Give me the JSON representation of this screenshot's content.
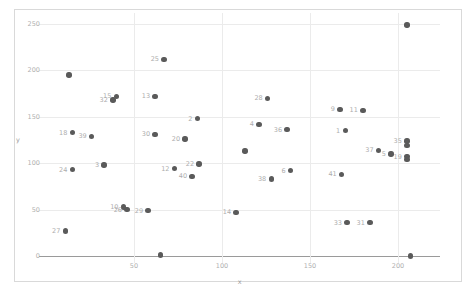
{
  "chart_data": {
    "type": "scatter",
    "title": "",
    "xlabel": "x",
    "ylabel": "y",
    "xlim": [
      -4,
      224
    ],
    "ylim": [
      -8,
      262
    ],
    "xticks": [
      50,
      100,
      150,
      200
    ],
    "yticks": [
      0,
      50,
      100,
      150,
      200,
      250
    ],
    "grid": true,
    "legend": "none",
    "point_color": "#5a5a5a",
    "label_color": "#adadad",
    "grid_color": "#ebebeb",
    "axis_color": "#9a9a9a",
    "points": [
      {
        "label": "23",
        "x": 207,
        "y": 0
      },
      {
        "label": "8",
        "x": 205,
        "y": 249
      },
      {
        "label": "25",
        "x": 67,
        "y": 212
      },
      {
        "label": "43",
        "x": 13,
        "y": 195
      },
      {
        "label": "15",
        "x": 40,
        "y": 172
      },
      {
        "label": "32",
        "x": 38,
        "y": 168
      },
      {
        "label": "13",
        "x": 62,
        "y": 172
      },
      {
        "label": "28",
        "x": 126,
        "y": 170
      },
      {
        "label": "9",
        "x": 167,
        "y": 158
      },
      {
        "label": "11",
        "x": 180,
        "y": 157
      },
      {
        "label": "2",
        "x": 86,
        "y": 148
      },
      {
        "label": "4",
        "x": 121,
        "y": 142
      },
      {
        "label": "36",
        "x": 137,
        "y": 136
      },
      {
        "label": "1",
        "x": 170,
        "y": 135
      },
      {
        "label": "18",
        "x": 15,
        "y": 133
      },
      {
        "label": "39",
        "x": 26,
        "y": 129
      },
      {
        "label": "30",
        "x": 62,
        "y": 131
      },
      {
        "label": "20",
        "x": 79,
        "y": 126
      },
      {
        "label": "35",
        "x": 205,
        "y": 124
      },
      {
        "label": "22b",
        "x": 205,
        "y": 119
      },
      {
        "label": "37",
        "x": 189,
        "y": 114
      },
      {
        "label": "33a",
        "x": 113,
        "y": 113
      },
      {
        "label": "5",
        "x": 196,
        "y": 110
      },
      {
        "label": "19",
        "x": 205,
        "y": 107
      },
      {
        "label": "17",
        "x": 205,
        "y": 104
      },
      {
        "label": "3",
        "x": 33,
        "y": 98
      },
      {
        "label": "22",
        "x": 87,
        "y": 99
      },
      {
        "label": "24",
        "x": 15,
        "y": 93
      },
      {
        "label": "12",
        "x": 73,
        "y": 94
      },
      {
        "label": "6",
        "x": 139,
        "y": 92
      },
      {
        "label": "41",
        "x": 168,
        "y": 88
      },
      {
        "label": "40",
        "x": 83,
        "y": 86
      },
      {
        "label": "38",
        "x": 128,
        "y": 83
      },
      {
        "label": "10",
        "x": 44,
        "y": 53
      },
      {
        "label": "26",
        "x": 46,
        "y": 50
      },
      {
        "label": "29",
        "x": 58,
        "y": 49
      },
      {
        "label": "14",
        "x": 108,
        "y": 47
      },
      {
        "label": "33",
        "x": 171,
        "y": 36
      },
      {
        "label": "31",
        "x": 184,
        "y": 36
      },
      {
        "label": "27",
        "x": 11,
        "y": 27
      },
      {
        "label": "7",
        "x": 65,
        "y": 1
      }
    ],
    "hidden_labels": [
      "8",
      "23",
      "43",
      "7",
      "22b",
      "17",
      "33a"
    ]
  }
}
